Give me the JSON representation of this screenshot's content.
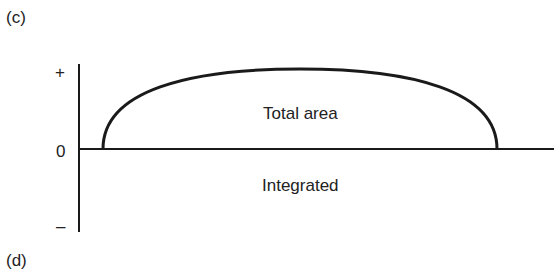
{
  "panels": {
    "top_label": "(c)",
    "bottom_label": "(d)"
  },
  "axis": {
    "plus_label": "+",
    "zero_label": "0",
    "minus_label": "–"
  },
  "annotations": {
    "above_baseline": "Total area",
    "below_baseline": "Integrated"
  },
  "colors": {
    "line": "#1a1a1a",
    "text": "#222222",
    "background": "#ffffff"
  }
}
